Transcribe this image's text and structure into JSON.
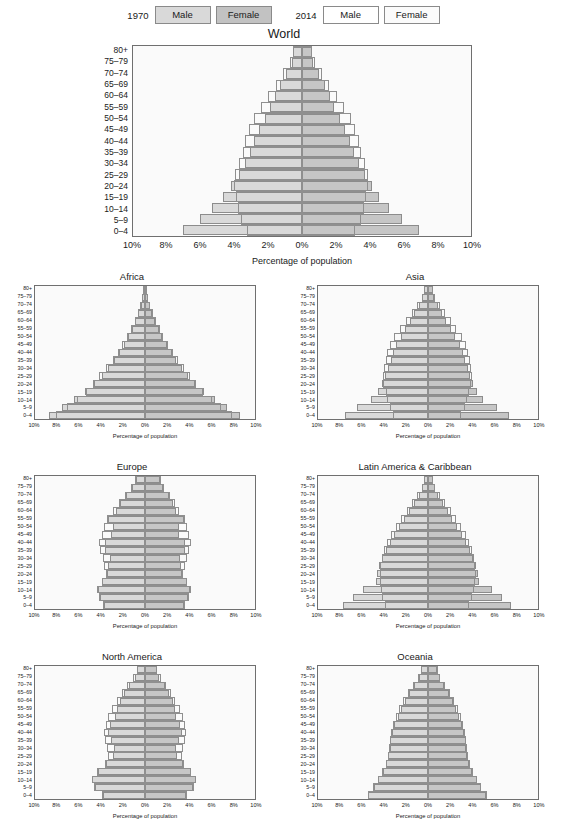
{
  "legend": {
    "groups": [
      {
        "year": "1970",
        "male_label": "Male",
        "female_label": "Female",
        "style": "filled"
      },
      {
        "year": "2014",
        "male_label": "Male",
        "female_label": "Female",
        "style": "outline"
      }
    ]
  },
  "colors": {
    "male_fill": "#d9d9d9",
    "female_fill": "#c6c6c6",
    "outline_stroke": "#8f8f8f",
    "panel_bg": "#fafafa",
    "axis": "#6f6f6f"
  },
  "axis": {
    "xlabel": "Percentage of population",
    "xticks": [
      "10%",
      "8%",
      "6%",
      "4%",
      "2%",
      "0%",
      "2%",
      "4%",
      "6%",
      "8%",
      "10%"
    ],
    "xlim": [
      -10,
      10
    ],
    "age_groups": [
      "80+",
      "75–79",
      "70–74",
      "65–69",
      "60–64",
      "55–59",
      "50–54",
      "45–49",
      "40–44",
      "35–39",
      "30–34",
      "25–29",
      "20–24",
      "15–19",
      "10–14",
      "5–9",
      "0–4"
    ]
  },
  "chart_data": {
    "type": "bar",
    "subtype": "population-pyramid",
    "xlabel": "Percentage of population",
    "ylabel": "Age group",
    "xlim": [
      -10,
      10
    ],
    "grid": false,
    "legend_position": "top-center",
    "categories": [
      "80+",
      "75–79",
      "70–74",
      "65–69",
      "60–64",
      "55–59",
      "50–54",
      "45–49",
      "40–44",
      "35–39",
      "30–34",
      "25–29",
      "20–24",
      "15–19",
      "10–14",
      "5–9",
      "0–4"
    ],
    "panels": [
      {
        "name": "World",
        "layout": "big",
        "series": [
          {
            "name": "1970 Male",
            "year": "1970",
            "sex": "male",
            "style": "filled",
            "values": [
              0.55,
              0.62,
              0.95,
              1.3,
              1.62,
              1.9,
              2.2,
              2.55,
              2.85,
              3.05,
              3.35,
              3.7,
              4.2,
              4.65,
              5.3,
              6.05,
              7.05
            ]
          },
          {
            "name": "1970 Female",
            "year": "1970",
            "sex": "female",
            "style": "filled",
            "values": [
              0.6,
              0.68,
              1.0,
              1.35,
              1.65,
              1.92,
              2.22,
              2.55,
              2.85,
              3.05,
              3.35,
              3.7,
              4.15,
              4.55,
              5.15,
              5.9,
              6.9
            ]
          },
          {
            "name": "2014 Male",
            "year": "2014",
            "sex": "male",
            "style": "outline",
            "values": [
              0.55,
              0.7,
              1.1,
              1.55,
              2.0,
              2.45,
              2.85,
              3.15,
              3.35,
              3.5,
              3.75,
              3.95,
              4.0,
              3.9,
              3.8,
              3.6,
              3.25
            ]
          },
          {
            "name": "2014 Female",
            "year": "2014",
            "sex": "female",
            "style": "outline",
            "values": [
              0.6,
              0.78,
              1.2,
              1.62,
              2.05,
              2.48,
              2.88,
              3.15,
              3.35,
              3.48,
              3.7,
              3.88,
              3.92,
              3.8,
              3.68,
              3.48,
              3.12
            ]
          }
        ]
      },
      {
        "name": "Africa",
        "layout": "small",
        "series": [
          {
            "name": "1970 Male",
            "year": "1970",
            "sex": "male",
            "style": "filled",
            "values": [
              0.18,
              0.25,
              0.4,
              0.62,
              0.9,
              1.2,
              1.55,
              1.95,
              2.4,
              2.85,
              3.35,
              3.95,
              4.6,
              5.45,
              6.45,
              7.55,
              8.75
            ]
          },
          {
            "name": "1970 Female",
            "year": "1970",
            "sex": "female",
            "style": "filled",
            "values": [
              0.2,
              0.28,
              0.44,
              0.66,
              0.94,
              1.24,
              1.58,
              1.98,
              2.42,
              2.85,
              3.35,
              3.92,
              4.55,
              5.35,
              6.35,
              7.45,
              8.65
            ]
          },
          {
            "name": "2014 Male",
            "year": "2014",
            "sex": "male",
            "style": "outline",
            "values": [
              0.18,
              0.26,
              0.42,
              0.65,
              0.95,
              1.28,
              1.65,
              2.05,
              2.48,
              2.95,
              3.52,
              4.15,
              4.75,
              5.35,
              6.15,
              7.05,
              8.05
            ]
          },
          {
            "name": "2014 Female",
            "year": "2014",
            "sex": "female",
            "style": "outline",
            "values": [
              0.2,
              0.3,
              0.46,
              0.7,
              1.0,
              1.32,
              1.68,
              2.08,
              2.5,
              2.96,
              3.5,
              4.1,
              4.68,
              5.28,
              6.05,
              6.95,
              7.95
            ]
          }
        ]
      },
      {
        "name": "Asia",
        "layout": "small",
        "series": [
          {
            "name": "1970 Male",
            "year": "1970",
            "sex": "male",
            "style": "filled",
            "values": [
              0.4,
              0.52,
              0.85,
              1.25,
              1.65,
              2.05,
              2.45,
              2.9,
              3.2,
              3.4,
              3.65,
              3.9,
              4.15,
              4.55,
              5.15,
              6.45,
              7.55
            ]
          },
          {
            "name": "1970 Female",
            "year": "1970",
            "sex": "female",
            "style": "filled",
            "values": [
              0.44,
              0.58,
              0.92,
              1.3,
              1.68,
              2.08,
              2.45,
              2.88,
              3.18,
              3.38,
              3.62,
              3.85,
              4.1,
              4.45,
              5.0,
              6.25,
              7.35
            ]
          },
          {
            "name": "2014 Male",
            "year": "2014",
            "sex": "male",
            "style": "outline",
            "values": [
              0.4,
              0.58,
              0.98,
              1.48,
              2.0,
              2.55,
              3.05,
              3.45,
              3.7,
              3.85,
              4.0,
              4.1,
              4.05,
              3.85,
              3.7,
              3.5,
              3.15
            ]
          },
          {
            "name": "2014 Female",
            "year": "2014",
            "sex": "female",
            "style": "outline",
            "values": [
              0.45,
              0.66,
              1.08,
              1.56,
              2.06,
              2.58,
              3.05,
              3.42,
              3.66,
              3.8,
              3.95,
              4.02,
              3.95,
              3.75,
              3.58,
              3.38,
              3.02
            ]
          }
        ]
      },
      {
        "name": "Europe",
        "layout": "small",
        "series": [
          {
            "name": "1970 Male",
            "year": "1970",
            "sex": "male",
            "style": "filled",
            "values": [
              0.85,
              1.15,
              1.75,
              2.25,
              2.6,
              3.35,
              2.95,
              3.05,
              3.6,
              3.65,
              3.2,
              3.35,
              3.45,
              3.95,
              4.3,
              4.1,
              3.75
            ]
          },
          {
            "name": "1970 Female",
            "year": "1970",
            "sex": "female",
            "style": "filled",
            "values": [
              1.35,
              1.6,
              2.15,
              2.55,
              2.85,
              3.5,
              3.05,
              3.1,
              3.6,
              3.62,
              3.18,
              3.28,
              3.35,
              3.8,
              4.1,
              3.9,
              3.55
            ]
          },
          {
            "name": "2014 Male",
            "year": "2014",
            "sex": "male",
            "style": "outline",
            "values": [
              0.9,
              1.25,
              1.85,
              2.4,
              2.9,
              3.45,
              3.75,
              3.95,
              4.15,
              4.05,
              3.85,
              3.7,
              3.55,
              3.95,
              4.35,
              4.2,
              3.85
            ]
          },
          {
            "name": "2014 Female",
            "year": "2014",
            "sex": "female",
            "style": "outline",
            "values": [
              1.45,
              1.75,
              2.25,
              2.7,
              3.1,
              3.6,
              3.85,
              4.0,
              4.15,
              4.02,
              3.8,
              3.62,
              3.45,
              3.8,
              4.15,
              4.0,
              3.65
            ]
          }
        ]
      },
      {
        "name": "Latin America & Caribbean",
        "layout": "small",
        "series": [
          {
            "name": "1970 Male",
            "year": "1970",
            "sex": "male",
            "style": "filled",
            "values": [
              0.38,
              0.52,
              0.85,
              1.25,
              1.7,
              2.15,
              2.6,
              3.05,
              3.45,
              3.8,
              4.15,
              4.45,
              4.65,
              4.75,
              5.95,
              6.85,
              7.7
            ]
          },
          {
            "name": "1970 Female",
            "year": "1970",
            "sex": "female",
            "style": "filled",
            "values": [
              0.44,
              0.6,
              0.94,
              1.34,
              1.78,
              2.22,
              2.65,
              3.08,
              3.46,
              3.8,
              4.12,
              4.4,
              4.58,
              4.65,
              5.8,
              6.7,
              7.55
            ]
          },
          {
            "name": "2014 Male",
            "year": "2014",
            "sex": "male",
            "style": "outline",
            "values": [
              0.4,
              0.58,
              0.98,
              1.45,
              1.95,
              2.45,
              2.95,
              3.4,
              3.75,
              4.0,
              4.2,
              4.35,
              4.4,
              4.35,
              4.3,
              4.15,
              3.9
            ]
          },
          {
            "name": "2014 Female",
            "year": "2014",
            "sex": "female",
            "style": "outline",
            "values": [
              0.48,
              0.68,
              1.1,
              1.58,
              2.05,
              2.55,
              3.0,
              3.42,
              3.74,
              3.96,
              4.15,
              4.28,
              4.32,
              4.26,
              4.18,
              4.02,
              3.76
            ]
          }
        ]
      },
      {
        "name": "North America",
        "layout": "small",
        "series": [
          {
            "name": "1970 Male",
            "year": "1970",
            "sex": "male",
            "style": "filled",
            "values": [
              0.7,
              0.95,
              1.45,
              1.9,
              2.25,
              2.55,
              2.75,
              3.15,
              3.35,
              3.05,
              2.85,
              2.95,
              3.55,
              4.3,
              4.8,
              4.55,
              3.85
            ]
          },
          {
            "name": "1970 Female",
            "year": "1970",
            "sex": "female",
            "style": "filled",
            "values": [
              1.05,
              1.3,
              1.8,
              2.2,
              2.5,
              2.7,
              2.85,
              3.2,
              3.38,
              3.05,
              2.82,
              2.9,
              3.45,
              4.15,
              4.6,
              4.35,
              3.7
            ]
          },
          {
            "name": "2014 Male",
            "year": "2014",
            "sex": "male",
            "style": "outline",
            "values": [
              0.75,
              1.05,
              1.6,
              2.1,
              2.55,
              3.0,
              3.35,
              3.55,
              3.7,
              3.65,
              3.5,
              3.4,
              3.6,
              4.35,
              4.85,
              4.6,
              3.95
            ]
          },
          {
            "name": "2014 Female",
            "year": "2014",
            "sex": "female",
            "style": "outline",
            "values": [
              1.1,
              1.42,
              1.92,
              2.36,
              2.76,
              3.15,
              3.45,
              3.62,
              3.72,
              3.64,
              3.46,
              3.34,
              3.52,
              4.2,
              4.68,
              4.42,
              3.8
            ]
          }
        ]
      },
      {
        "name": "Oceania",
        "layout": "small",
        "series": [
          {
            "name": "1970 Male",
            "year": "1970",
            "sex": "male",
            "style": "filled",
            "values": [
              0.62,
              0.82,
              1.25,
              1.7,
              2.1,
              2.45,
              2.75,
              3.05,
              3.3,
              3.45,
              3.5,
              3.6,
              3.8,
              4.1,
              4.55,
              4.95,
              5.45
            ]
          },
          {
            "name": "1970 Female",
            "year": "1970",
            "sex": "female",
            "style": "filled",
            "values": [
              0.85,
              1.05,
              1.48,
              1.9,
              2.25,
              2.55,
              2.82,
              3.08,
              3.3,
              3.42,
              3.46,
              3.54,
              3.72,
              4.0,
              4.42,
              4.8,
              5.3
            ]
          },
          {
            "name": "2014 Male",
            "year": "2014",
            "sex": "male",
            "style": "outline",
            "values": [
              0.65,
              0.88,
              1.35,
              1.82,
              2.25,
              2.62,
              2.92,
              3.18,
              3.38,
              3.5,
              3.56,
              3.65,
              3.85,
              4.15,
              4.58,
              4.98,
              5.48
            ]
          },
          {
            "name": "2014 Female",
            "year": "2014",
            "sex": "female",
            "style": "outline",
            "values": [
              0.9,
              1.12,
              1.58,
              2.02,
              2.38,
              2.7,
              2.96,
              3.2,
              3.38,
              3.48,
              3.52,
              3.6,
              3.78,
              4.05,
              4.46,
              4.84,
              5.34
            ]
          }
        ]
      }
    ]
  }
}
